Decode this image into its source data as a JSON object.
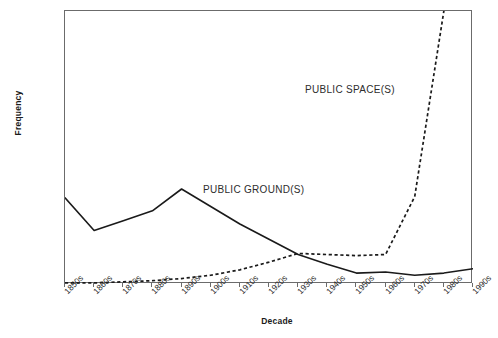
{
  "chart_data": {
    "type": "line",
    "title": "",
    "xlabel": "Decade",
    "ylabel": "Frequency",
    "categories": [
      "1850s",
      "1860s",
      "1870s",
      "1880s",
      "1890s",
      "1900s",
      "1910s",
      "1920s",
      "1930s",
      "1940s",
      "1950s",
      "1960s",
      "1970s",
      "1980s",
      "1990s"
    ],
    "ylim": [
      0,
      250
    ],
    "yticks": [
      0,
      50,
      100,
      150,
      200,
      250
    ],
    "grid": false,
    "legend_position": "inline-annotation",
    "series": [
      {
        "name": "PUBLIC GROUND(S)",
        "style": "solid",
        "color": "#1a1a1a",
        "values": [
          79,
          49,
          58,
          67,
          87,
          71,
          55,
          41,
          27,
          18,
          10,
          11,
          8,
          10,
          14
        ]
      },
      {
        "name": "PUBLIC SPACE(S)",
        "style": "dashed",
        "color": "#1a1a1a",
        "values": [
          1,
          1,
          2,
          3,
          5,
          8,
          13,
          20,
          28,
          27,
          26,
          27,
          80,
          250,
          420
        ]
      }
    ],
    "annotations": [
      {
        "text": "PUBLIC GROUND(S)",
        "series": "PUBLIC GROUND(S)"
      },
      {
        "text": "PUBLIC SPACE(S)",
        "series": "PUBLIC SPACE(S)"
      }
    ]
  },
  "axis": {
    "y_tick_labels": [
      "0",
      "50",
      "100",
      "150",
      "200",
      "250"
    ],
    "x_tick_labels": [
      "1850s",
      "1860s",
      "1870s",
      "1880s",
      "1890s",
      "1900s",
      "1910s",
      "1920s",
      "1930s",
      "1940s",
      "1950s",
      "1960s",
      "1970s",
      "1980s",
      "1990s"
    ],
    "y_title": "Frequency",
    "x_title": "Decade"
  },
  "colors": {
    "frame": "#6b6b6b",
    "series_line": "#1a1a1a",
    "background": "#ffffff",
    "text": "#1a1a1a"
  }
}
